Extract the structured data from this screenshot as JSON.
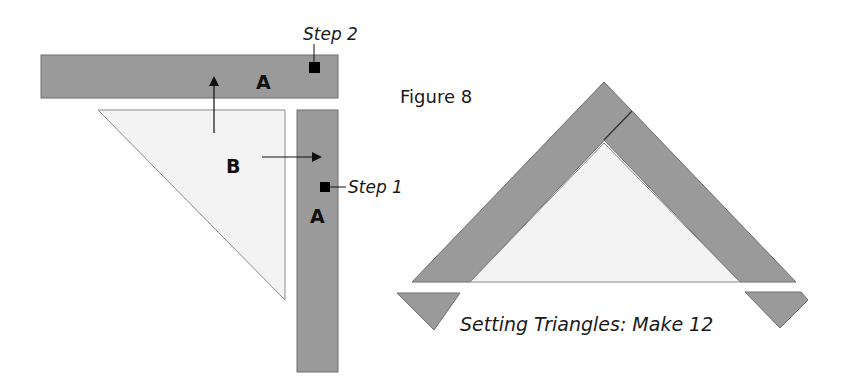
{
  "figure": {
    "title": "Figure 8",
    "caption": "Setting Triangles: Make 12",
    "colors": {
      "strip_fill": "#9a9a9a",
      "strip_stroke": "#6e6e6e",
      "triangle_fill": "#f3f3f3",
      "marker": "#000000",
      "background": "#ffffff"
    }
  },
  "assembly": {
    "top_strip_label": "A",
    "side_strip_label": "A",
    "triangle_label": "B",
    "step1_label": "Step 1",
    "step2_label": "Step 2"
  }
}
